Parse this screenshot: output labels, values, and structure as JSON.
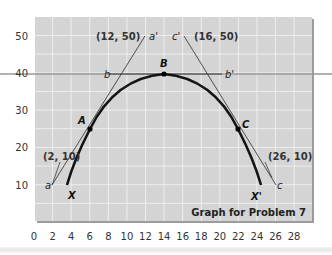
{
  "chart_data": {
    "type": "line",
    "title": "Graph for Problem 7",
    "xlabel": "",
    "ylabel": "",
    "xlim": [
      0,
      28
    ],
    "ylim": [
      0,
      55
    ],
    "x_ticks": [
      "0",
      "2",
      "4",
      "6",
      "8",
      "10",
      "12",
      "14",
      "16",
      "18",
      "20",
      "22",
      "24",
      "26",
      "28"
    ],
    "y_ticks": [
      "10",
      "20",
      "30",
      "40",
      "50"
    ],
    "grid": true,
    "series": [
      {
        "name": "XX' curve",
        "points": [
          [
            3.5,
            10
          ],
          [
            6,
            25
          ],
          [
            10,
            36
          ],
          [
            14,
            40
          ],
          [
            18,
            36
          ],
          [
            22,
            25
          ],
          [
            24.5,
            10
          ]
        ]
      },
      {
        "name": "aa' tangent at A",
        "points": [
          [
            2,
            10
          ],
          [
            12,
            50
          ]
        ]
      },
      {
        "name": "bb' tangent at B",
        "points": [
          [
            8,
            40
          ],
          [
            20,
            40
          ]
        ]
      },
      {
        "name": "cc' tangent at C",
        "points": [
          [
            16,
            50
          ],
          [
            26,
            10
          ]
        ]
      }
    ],
    "points": [
      {
        "label": "A",
        "x": 6,
        "y": 25
      },
      {
        "label": "B",
        "x": 14,
        "y": 40
      },
      {
        "label": "C",
        "x": 22,
        "y": 25
      }
    ],
    "annotations": [
      {
        "text": "(12, 50)",
        "x": 12,
        "y": 50
      },
      {
        "text": "(16, 50)",
        "x": 16,
        "y": 50
      },
      {
        "text": "(2, 10)",
        "x": 2,
        "y": 10
      },
      {
        "text": "(26, 10)",
        "x": 26,
        "y": 10
      },
      {
        "text": "a",
        "x": 2,
        "y": 10
      },
      {
        "text": "a'",
        "x": 12,
        "y": 50
      },
      {
        "text": "b",
        "x": 8,
        "y": 40
      },
      {
        "text": "b'",
        "x": 20,
        "y": 40
      },
      {
        "text": "c",
        "x": 26,
        "y": 10
      },
      {
        "text": "c'",
        "x": 16,
        "y": 50
      },
      {
        "text": "X",
        "x": 3.5,
        "y": 10
      },
      {
        "text": "X'",
        "x": 24.5,
        "y": 10
      }
    ]
  },
  "labels": {
    "caption": "Graph for Problem 7",
    "coord_a_prime": "(12, 50)",
    "coord_c_prime": "(16, 50)",
    "coord_a": "(2, 10)",
    "coord_c": "(26, 10)",
    "a": "a",
    "a_prime": "a'",
    "b": "b",
    "b_prime": "b'",
    "c": "c",
    "c_prime": "c'",
    "A": "A",
    "B": "B",
    "C": "C",
    "X": "X",
    "X_prime": "X'"
  },
  "colors": {
    "plot_bg": "#d4d4d4",
    "grid": "#f2f2f2",
    "curve": "#1a1a1a",
    "tangent": "#333333",
    "guide_line": "#9a9a9a"
  }
}
